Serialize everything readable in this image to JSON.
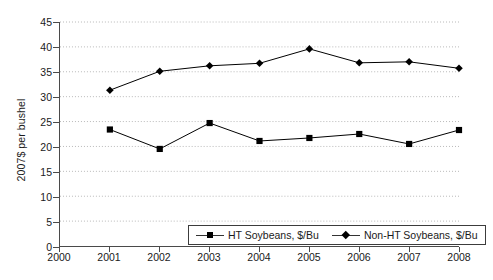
{
  "chart_data": {
    "type": "line",
    "title": "",
    "xlabel": "",
    "ylabel": "2007$ per bushel",
    "x": [
      2001,
      2002,
      2003,
      2004,
      2005,
      2006,
      2007,
      2008
    ],
    "xlim": [
      2000,
      2008
    ],
    "ylim": [
      0,
      45
    ],
    "xticks": [
      "2000",
      "2001",
      "2002",
      "2003",
      "2004",
      "2005",
      "2006",
      "2007",
      "2008"
    ],
    "yticks": [
      "0",
      "5",
      "10",
      "15",
      "20",
      "25",
      "30",
      "35",
      "40",
      "45"
    ],
    "grid": true,
    "legend_position": "bottom-center",
    "series": [
      {
        "name": "HT Soybeans, $/Bu",
        "marker": "square",
        "color": "#000000",
        "values": [
          23.4,
          19.5,
          24.7,
          21.1,
          21.7,
          22.5,
          20.5,
          23.3
        ]
      },
      {
        "name": "Non-HT Soybeans, $/Bu",
        "marker": "diamond",
        "color": "#000000",
        "values": [
          31.3,
          35.1,
          36.2,
          36.7,
          39.6,
          36.8,
          37.0,
          35.7
        ]
      }
    ]
  }
}
